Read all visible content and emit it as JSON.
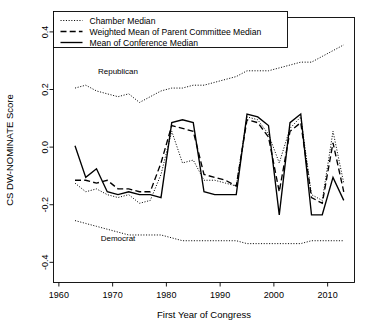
{
  "chart_data": {
    "type": "line",
    "title": "",
    "xlabel": "First Year of Congress",
    "ylabel": "CS DW-NOMINATE Score",
    "xlim": [
      1959,
      2015
    ],
    "ylim": [
      -0.47,
      0.45
    ],
    "xticks": [
      1960,
      1970,
      1980,
      1990,
      2000,
      2010
    ],
    "xticklabels": [
      "1960",
      "1970",
      "1980",
      "1990",
      "2000",
      "2010"
    ],
    "yticks": [
      -0.4,
      -0.2,
      0.0,
      0.2,
      0.4
    ],
    "yticklabels": [
      "-0.4",
      "-0.2",
      "0.0",
      "0.2",
      "0.4"
    ],
    "grid": false,
    "legend_position": "top-left",
    "annotations": [
      {
        "text": "Republican",
        "x": 1971,
        "y": 0.255
      },
      {
        "text": "Democrat",
        "x": 1971,
        "y": -0.325
      }
    ],
    "series": [
      {
        "name": "Chamber Median",
        "style": "dotted",
        "x": [
          1963,
          1965,
          1967,
          1969,
          1971,
          1973,
          1975,
          1977,
          1979,
          1981,
          1983,
          1985,
          1987,
          1989,
          1991,
          1993,
          1995,
          1997,
          1999,
          2001,
          2003,
          2005,
          2007,
          2009,
          2011,
          2013
        ],
        "y": [
          -0.125,
          -0.155,
          -0.145,
          -0.165,
          -0.175,
          -0.165,
          -0.195,
          -0.185,
          -0.095,
          0.055,
          -0.055,
          -0.045,
          -0.115,
          -0.115,
          -0.125,
          -0.135,
          0.105,
          0.095,
          0.045,
          -0.055,
          0.065,
          0.105,
          -0.165,
          -0.185,
          0.055,
          -0.125
        ]
      },
      {
        "name": "Weighted Mean of Parent Committee Median",
        "style": "dashed",
        "x": [
          1963,
          1965,
          1967,
          1969,
          1971,
          1973,
          1975,
          1977,
          1979,
          1981,
          1983,
          1985,
          1987,
          1989,
          1991,
          1993,
          1995,
          1997,
          1999,
          2001,
          2003,
          2005,
          2007,
          2009,
          2011,
          2013
        ],
        "y": [
          -0.115,
          -0.115,
          -0.125,
          -0.115,
          -0.145,
          -0.145,
          -0.155,
          -0.155,
          -0.055,
          0.075,
          0.065,
          0.055,
          -0.095,
          -0.105,
          -0.115,
          -0.135,
          0.095,
          0.085,
          0.035,
          -0.155,
          0.055,
          0.085,
          -0.175,
          -0.195,
          0.015,
          -0.155
        ]
      },
      {
        "name": "Mean of Conference Median",
        "style": "solid",
        "x": [
          1963,
          1965,
          1967,
          1969,
          1971,
          1973,
          1975,
          1977,
          1979,
          1981,
          1983,
          1985,
          1987,
          1989,
          1991,
          1993,
          1995,
          1997,
          1999,
          2001,
          2003,
          2005,
          2007,
          2009,
          2011,
          2013
        ],
        "y": [
          0.005,
          -0.105,
          -0.075,
          -0.155,
          -0.165,
          -0.155,
          -0.165,
          -0.165,
          -0.175,
          0.085,
          0.095,
          0.085,
          -0.155,
          -0.165,
          -0.165,
          -0.165,
          0.115,
          0.105,
          0.075,
          -0.235,
          0.085,
          0.115,
          -0.235,
          -0.235,
          -0.105,
          -0.185
        ]
      },
      {
        "name": "Republican",
        "style": "dotted",
        "x": [
          1963,
          1965,
          1967,
          1969,
          1971,
          1973,
          1975,
          1977,
          1979,
          1981,
          1983,
          1985,
          1987,
          1989,
          1991,
          1993,
          1995,
          1997,
          1999,
          2001,
          2003,
          2005,
          2007,
          2009,
          2011,
          2013
        ],
        "y": [
          0.205,
          0.215,
          0.195,
          0.185,
          0.175,
          0.185,
          0.155,
          0.175,
          0.195,
          0.205,
          0.205,
          0.215,
          0.215,
          0.225,
          0.235,
          0.245,
          0.265,
          0.265,
          0.265,
          0.275,
          0.285,
          0.295,
          0.295,
          0.315,
          0.335,
          0.355
        ]
      },
      {
        "name": "Democrat",
        "style": "dotted",
        "x": [
          1963,
          1965,
          1967,
          1969,
          1971,
          1973,
          1975,
          1977,
          1979,
          1981,
          1983,
          1985,
          1987,
          1989,
          1991,
          1993,
          1995,
          1997,
          1999,
          2001,
          2003,
          2005,
          2007,
          2009,
          2011,
          2013
        ],
        "y": [
          -0.255,
          -0.265,
          -0.275,
          -0.285,
          -0.295,
          -0.305,
          -0.305,
          -0.305,
          -0.305,
          -0.315,
          -0.325,
          -0.325,
          -0.325,
          -0.325,
          -0.325,
          -0.325,
          -0.335,
          -0.335,
          -0.335,
          -0.335,
          -0.335,
          -0.335,
          -0.325,
          -0.325,
          -0.325,
          -0.325
        ]
      }
    ]
  },
  "legend": {
    "entries": [
      {
        "label": "Chamber Median",
        "style": "dotted"
      },
      {
        "label": "Weighted Mean of Parent Committee Median",
        "style": "dashed"
      },
      {
        "label": "Mean of Conference Median",
        "style": "solid"
      }
    ]
  },
  "axes": {
    "x_title": "First Year of Congress",
    "y_title": "CS DW-NOMINATE Score"
  }
}
